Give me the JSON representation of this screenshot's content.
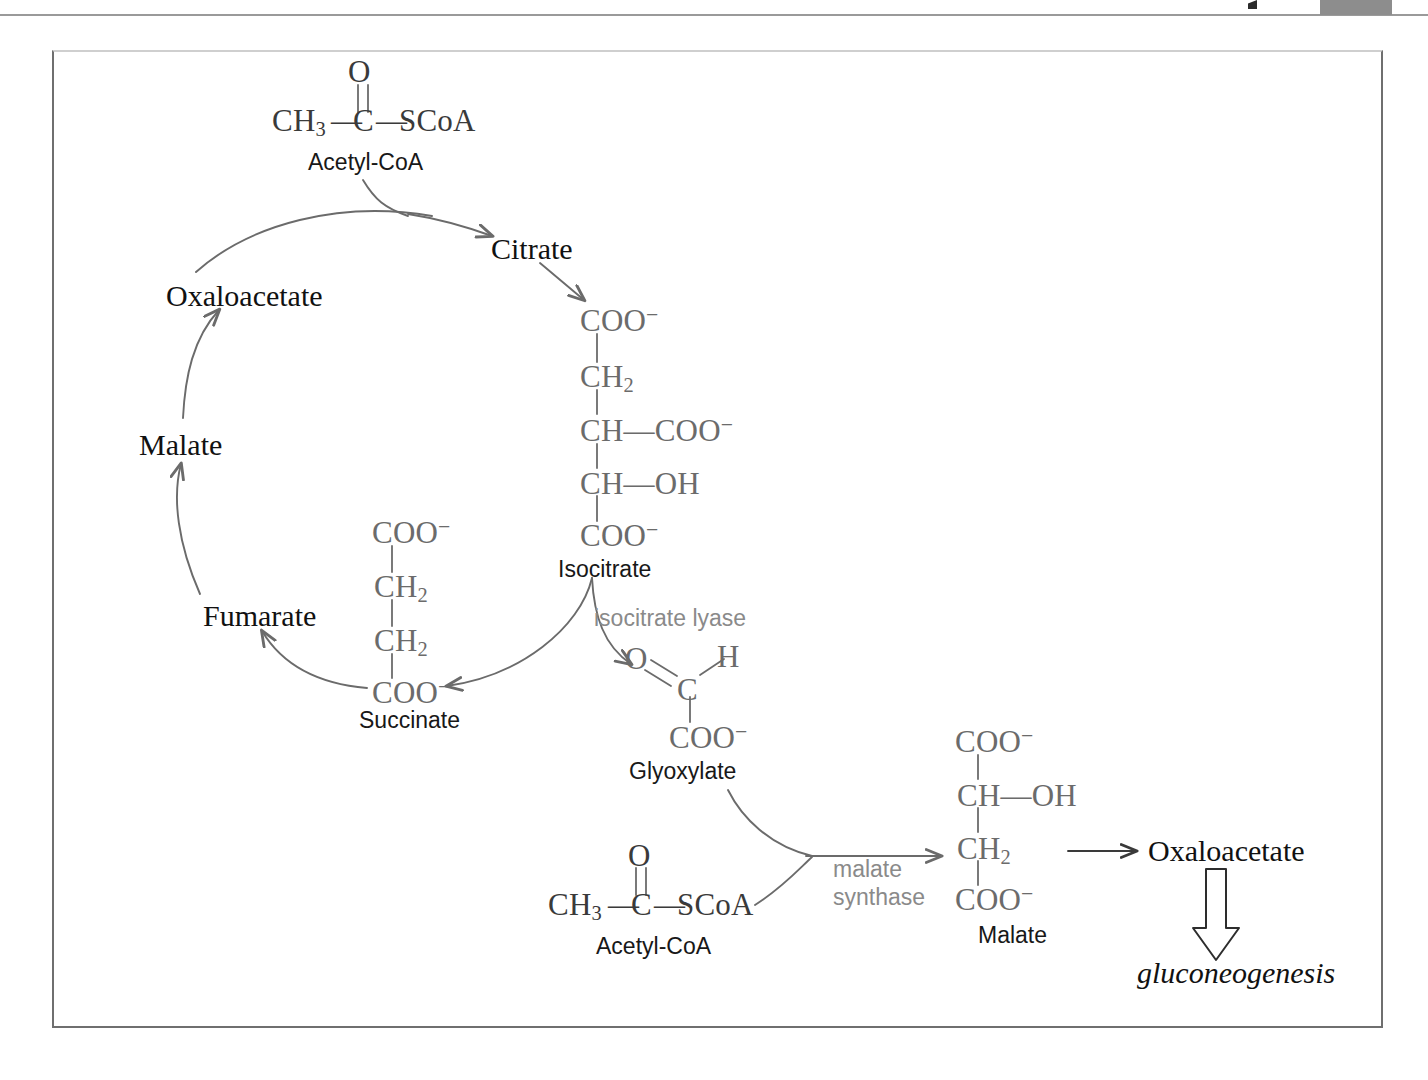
{
  "page": {
    "edge_tab": "",
    "header_mark": ""
  },
  "diagram": {
    "cycle_nodes": [
      {
        "id": "citrate",
        "label": "Citrate"
      },
      {
        "id": "oxaloacetate",
        "label": "Oxaloacetate"
      },
      {
        "id": "malate",
        "label": "Malate"
      },
      {
        "id": "fumarate",
        "label": "Fumarate"
      },
      {
        "id": "oxaloacetate2",
        "label": "Oxaloacetate"
      }
    ],
    "captions": [
      {
        "id": "acetyl-coa-top",
        "label": "Acetyl-CoA"
      },
      {
        "id": "isocitrate",
        "label": "Isocitrate"
      },
      {
        "id": "succinate",
        "label": "Succinate"
      },
      {
        "id": "glyoxylate",
        "label": "Glyoxylate"
      },
      {
        "id": "acetyl-coa-bottom",
        "label": "Acetyl-CoA"
      },
      {
        "id": "malate-structure",
        "label": "Malate"
      }
    ],
    "enzymes": [
      {
        "id": "isocitrate-lyase",
        "label": "isocitrate lyase"
      },
      {
        "id": "malate-synthase",
        "label": "malate\nsynthase"
      }
    ],
    "outputs": [
      {
        "id": "gluconeogenesis",
        "label": "gluconeogenesis"
      }
    ],
    "structures": {
      "acetyl_coa_top": {
        "carbonyl_oxygen": "O",
        "methyl": "CH",
        "methyl_sub": "3",
        "dash_left": "—",
        "carbon": "C",
        "dash_right": "—",
        "thioester": "SCoA"
      },
      "acetyl_coa_bottom": {
        "carbonyl_oxygen": "O",
        "methyl": "CH",
        "methyl_sub": "3",
        "dash_left": "—",
        "carbon": "C",
        "dash_right": "—",
        "thioester": "SCoA"
      },
      "isocitrate": {
        "rows": [
          {
            "main": "COO",
            "sup": "−",
            "branch": ""
          },
          {
            "main": "CH",
            "sub": "2",
            "branch": ""
          },
          {
            "main": "CH",
            "branch": "—COO",
            "branch_sup": "−"
          },
          {
            "main": "CH",
            "branch": "—OH"
          },
          {
            "main": "COO",
            "sup": "−",
            "branch": ""
          }
        ]
      },
      "succinate": {
        "rows": [
          {
            "main": "COO",
            "sup": "−"
          },
          {
            "main": "CH",
            "sub": "2"
          },
          {
            "main": "CH",
            "sub": "2"
          },
          {
            "main": "COO",
            "sup": "−"
          }
        ]
      },
      "glyoxylate": {
        "oxygen": "O",
        "hydrogen": "H",
        "carbon": "C",
        "carboxylate": "COO",
        "carboxylate_sup": "−"
      },
      "malate": {
        "rows": [
          {
            "main": "COO",
            "sup": "−"
          },
          {
            "main": "CH",
            "branch": "—OH"
          },
          {
            "main": "CH",
            "sub": "2"
          },
          {
            "main": "COO",
            "sup": "−"
          }
        ]
      }
    },
    "colors": {
      "frame": "#6f6f6f",
      "arrow": "#6b6b6b",
      "enzyme_text": "#8a8a8a",
      "formula_text": "#6b6b6b",
      "label_text": "#111111",
      "edge_tab": "#8d8d8d"
    }
  }
}
